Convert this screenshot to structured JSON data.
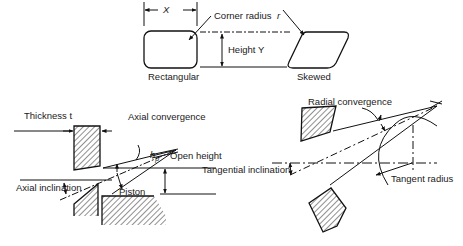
{
  "diagram": {
    "top": {
      "dimension_x": "X",
      "corner_radius_label": "Corner radius",
      "radius_symbol": "r",
      "height_label": "Height Y",
      "shape_left_label": "Rectangular",
      "shape_right_label": "Skewed"
    },
    "left_section": {
      "thickness_label": "Thickness t",
      "axial_convergence_label": "Axial convergence",
      "hp_symbol": "h",
      "hp_subscript": "p",
      "open_height_label": "Open height",
      "axial_inclination_label": "Axial inclination",
      "piston_label": "Piston"
    },
    "right_section": {
      "radial_convergence_label": "Radial convergence",
      "tangential_inclination_label": "Tangential inclination",
      "tangent_radius_label": "Tangent radius"
    }
  }
}
